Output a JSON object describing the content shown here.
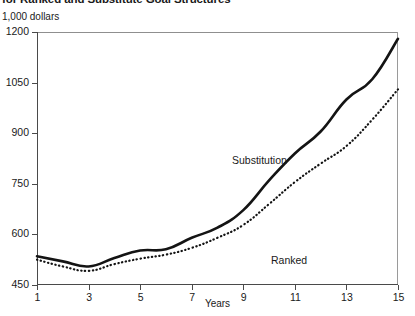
{
  "title": "for Ranked and Substitute Goal Structures",
  "y_unit_label": "1,000 dollars",
  "x_axis_title": "Years",
  "series_labels": {
    "substitution": "Substitution",
    "ranked": "Ranked"
  },
  "colors": {
    "line": "#141414",
    "axis": "#4a4a4a",
    "background": "#ffffff"
  },
  "chart_data": {
    "type": "line",
    "title": "for Ranked and Substitute Goal Structures",
    "xlabel": "Years",
    "ylabel": "1,000 dollars",
    "xlim": [
      1,
      15
    ],
    "ylim": [
      450,
      1200
    ],
    "yticks": [
      450,
      600,
      750,
      900,
      1050,
      1200
    ],
    "xticks": [
      1,
      3,
      5,
      7,
      9,
      11,
      13,
      15
    ],
    "grid": false,
    "legend": "in-plot labels",
    "x": [
      1,
      2,
      3,
      4,
      5,
      6,
      7,
      8,
      9,
      10,
      11,
      12,
      13,
      14,
      15
    ],
    "series": [
      {
        "name": "Substitution",
        "style": "solid",
        "values": [
          535,
          520,
          505,
          530,
          552,
          556,
          590,
          620,
          672,
          760,
          840,
          905,
          1000,
          1060,
          1180
        ]
      },
      {
        "name": "Ranked",
        "style": "dotted",
        "values": [
          525,
          505,
          492,
          512,
          528,
          540,
          560,
          590,
          628,
          690,
          755,
          810,
          862,
          940,
          1030
        ]
      }
    ]
  }
}
